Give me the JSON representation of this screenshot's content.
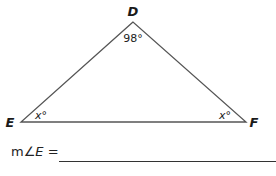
{
  "diagram": {
    "type": "triangle",
    "vertices": [
      {
        "name": "D",
        "label": "D",
        "x": 133,
        "y": 22
      },
      {
        "name": "E",
        "label": "E",
        "x": 21,
        "y": 122
      },
      {
        "name": "F",
        "label": "F",
        "x": 246,
        "y": 122
      }
    ],
    "angles": {
      "D": {
        "value": "98",
        "unit": "°",
        "text": "98°"
      },
      "E": {
        "value": "x",
        "unit": "°",
        "text": "x°"
      },
      "F": {
        "value": "x",
        "unit": "°",
        "text": "x°"
      }
    },
    "colors": {
      "stroke": "#555555",
      "text": "#1a1a1a"
    }
  },
  "question": {
    "prompt_prefix": "m∠",
    "prompt_var": "E",
    "prompt_suffix": " =",
    "answer": ""
  }
}
